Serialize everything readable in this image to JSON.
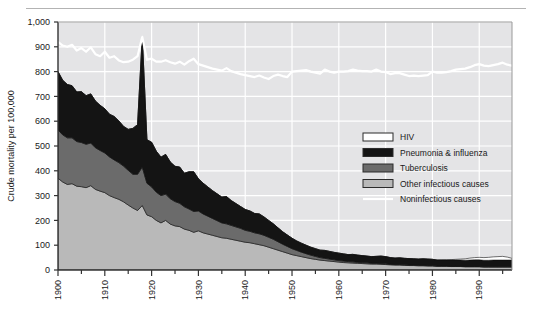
{
  "chart_data": {
    "type": "area",
    "stacked": true,
    "title": "",
    "xlabel": "",
    "ylabel": "Crude mortality per 100,000",
    "xlim": [
      1900,
      1997
    ],
    "ylim": [
      0,
      1000
    ],
    "grid": true,
    "legend_position": "center-right",
    "xticks": [
      1900,
      1910,
      1920,
      1930,
      1940,
      1950,
      1960,
      1970,
      1980,
      1990
    ],
    "xtick_labels": [
      "1900",
      "1910",
      "1920",
      "1930",
      "1940",
      "1950",
      "1960",
      "1970",
      "1980",
      "1990"
    ],
    "yticks": [
      0,
      100,
      200,
      300,
      400,
      500,
      600,
      700,
      800,
      900,
      1000
    ],
    "ytick_labels": [
      "0",
      "100",
      "200",
      "300",
      "400",
      "500",
      "600",
      "700",
      "800",
      "900",
      "1,000"
    ],
    "x": [
      1900,
      1901,
      1902,
      1903,
      1904,
      1905,
      1906,
      1907,
      1908,
      1909,
      1910,
      1911,
      1912,
      1913,
      1914,
      1915,
      1916,
      1917,
      1918,
      1919,
      1920,
      1921,
      1922,
      1923,
      1924,
      1925,
      1926,
      1927,
      1928,
      1929,
      1930,
      1931,
      1932,
      1933,
      1934,
      1935,
      1936,
      1937,
      1938,
      1939,
      1940,
      1941,
      1942,
      1943,
      1944,
      1945,
      1946,
      1947,
      1948,
      1949,
      1950,
      1951,
      1952,
      1953,
      1954,
      1955,
      1956,
      1957,
      1958,
      1959,
      1960,
      1961,
      1962,
      1963,
      1964,
      1965,
      1966,
      1967,
      1968,
      1969,
      1970,
      1971,
      1972,
      1973,
      1974,
      1975,
      1976,
      1977,
      1978,
      1979,
      1980,
      1981,
      1982,
      1983,
      1984,
      1985,
      1986,
      1987,
      1988,
      1989,
      1990,
      1991,
      1992,
      1993,
      1994,
      1995,
      1996,
      1997
    ],
    "series": [
      {
        "name": "Other infectious causes",
        "color": "#b9b9b9",
        "values": [
          370,
          355,
          345,
          348,
          338,
          336,
          332,
          340,
          325,
          318,
          312,
          300,
          292,
          285,
          275,
          262,
          250,
          240,
          260,
          222,
          215,
          200,
          190,
          200,
          185,
          178,
          175,
          165,
          160,
          152,
          158,
          150,
          145,
          140,
          135,
          130,
          128,
          124,
          120,
          116,
          112,
          110,
          106,
          102,
          98,
          92,
          86,
          80,
          74,
          68,
          62,
          58,
          54,
          50,
          46,
          43,
          40,
          38,
          36,
          34,
          32,
          30,
          29,
          28,
          27,
          26,
          25,
          24,
          24,
          23,
          22,
          21,
          20,
          20,
          19,
          18,
          18,
          17,
          17,
          16,
          16,
          15,
          15,
          15,
          14,
          14,
          14,
          13,
          13,
          13,
          13,
          12,
          12,
          12,
          12,
          12,
          12,
          12
        ]
      },
      {
        "name": "Tuberculosis",
        "color": "#6b6b6b",
        "values": [
          195,
          190,
          188,
          185,
          180,
          178,
          175,
          172,
          168,
          164,
          160,
          156,
          152,
          148,
          144,
          140,
          136,
          146,
          155,
          128,
          120,
          114,
          110,
          106,
          102,
          98,
          94,
          90,
          86,
          84,
          80,
          76,
          72,
          68,
          64,
          60,
          58,
          56,
          54,
          52,
          48,
          46,
          44,
          44,
          42,
          40,
          38,
          34,
          30,
          27,
          24,
          21,
          18,
          16,
          14,
          12,
          10,
          9,
          8,
          7,
          6,
          6,
          5,
          5,
          4,
          4,
          4,
          3,
          3,
          3,
          3,
          2,
          2,
          2,
          2,
          2,
          2,
          2,
          2,
          2,
          2,
          1,
          1,
          1,
          1,
          1,
          1,
          1,
          1,
          1,
          1,
          1,
          1,
          1,
          1,
          1,
          1,
          1
        ]
      },
      {
        "name": "Pneumonia & influenza",
        "color": "#141414",
        "values": [
          235,
          220,
          215,
          210,
          200,
          205,
          196,
          198,
          188,
          182,
          178,
          172,
          175,
          168,
          160,
          165,
          185,
          200,
          525,
          175,
          180,
          165,
          155,
          160,
          148,
          142,
          146,
          135,
          150,
          160,
          130,
          124,
          118,
          112,
          108,
          104,
          110,
          100,
          94,
          88,
          84,
          82,
          78,
          80,
          74,
          68,
          62,
          56,
          50,
          46,
          42,
          38,
          36,
          34,
          32,
          31,
          30,
          32,
          31,
          30,
          30,
          29,
          28,
          30,
          29,
          28,
          27,
          27,
          28,
          30,
          29,
          27,
          26,
          27,
          26,
          26,
          25,
          25,
          26,
          26,
          25,
          24,
          24,
          24,
          25,
          25,
          25,
          25,
          26,
          27,
          27,
          26,
          26,
          27,
          27,
          27,
          27,
          27
        ]
      },
      {
        "name": "HIV",
        "color": "#ffffff",
        "values": [
          0,
          0,
          0,
          0,
          0,
          0,
          0,
          0,
          0,
          0,
          0,
          0,
          0,
          0,
          0,
          0,
          0,
          0,
          0,
          0,
          0,
          0,
          0,
          0,
          0,
          0,
          0,
          0,
          0,
          0,
          0,
          0,
          0,
          0,
          0,
          0,
          0,
          0,
          0,
          0,
          0,
          0,
          0,
          0,
          0,
          0,
          0,
          0,
          0,
          0,
          0,
          0,
          0,
          0,
          0,
          0,
          0,
          0,
          0,
          0,
          0,
          0,
          0,
          0,
          0,
          0,
          0,
          0,
          0,
          0,
          0,
          0,
          0,
          0,
          0,
          0,
          0,
          0,
          0,
          0,
          0,
          0,
          1,
          1,
          2,
          3,
          4,
          6,
          8,
          9,
          10,
          11,
          12,
          13,
          14,
          15,
          12,
          7
        ]
      }
    ],
    "line_series": {
      "name": "Noninfectious causes",
      "color": "#ffffff",
      "description": "White line showing total crude mortality per 100,000",
      "values": [
        920,
        905,
        900,
        908,
        885,
        895,
        880,
        898,
        870,
        862,
        880,
        856,
        862,
        845,
        838,
        840,
        848,
        862,
        940,
        848,
        852,
        840,
        840,
        846,
        838,
        832,
        840,
        828,
        842,
        852,
        830,
        824,
        818,
        812,
        808,
        804,
        814,
        802,
        796,
        790,
        786,
        782,
        778,
        784,
        776,
        770,
        782,
        788,
        782,
        778,
        800,
        802,
        804,
        806,
        800,
        796,
        792,
        808,
        800,
        796,
        800,
        800,
        802,
        808,
        804,
        802,
        802,
        800,
        808,
        800,
        798,
        790,
        794,
        794,
        788,
        782,
        784,
        782,
        784,
        786,
        800,
        796,
        796,
        798,
        802,
        808,
        810,
        812,
        818,
        826,
        830,
        824,
        822,
        826,
        830,
        836,
        828,
        824
      ]
    }
  },
  "legend": {
    "items": [
      {
        "label": "HIV",
        "swatch": "white",
        "type": "box"
      },
      {
        "label": "Pneumonia & influenza",
        "swatch": "black",
        "type": "box"
      },
      {
        "label": "Tuberculosis",
        "swatch": "dark-gray",
        "type": "box"
      },
      {
        "label": "Other infectious causes",
        "swatch": "light-gray",
        "type": "box"
      },
      {
        "label": "Noninfectious causes",
        "swatch": "white",
        "type": "line"
      }
    ]
  },
  "colors": {
    "plot_background": "#e4e4e6",
    "gridline": "#ffffff",
    "axis": "#333333",
    "other_infectious": "#b9b9b9",
    "tuberculosis": "#6b6b6b",
    "pneumonia_influenza": "#141414",
    "hiv": "#ffffff",
    "noninfectious_line": "#ffffff",
    "text": "#1a1a1a"
  }
}
